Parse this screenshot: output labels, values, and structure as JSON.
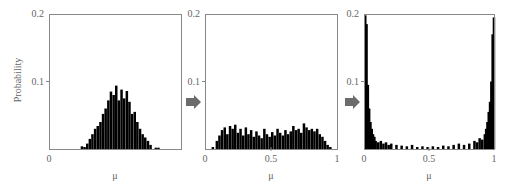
{
  "figure": {
    "ylabel": "Probability",
    "arrow_color": "#6b6b6b",
    "bar_color": "#000000",
    "frame_color": "#888888"
  },
  "chart_data": [
    {
      "type": "bar",
      "title": "",
      "xlabel": "μ",
      "ylabel": "Probability",
      "xlim": [
        0,
        1
      ],
      "ylim": [
        0,
        0.2
      ],
      "xticks": [
        "0"
      ],
      "yticks": [
        "0.1",
        "0.2"
      ],
      "grid": false,
      "description": "Unimodal distribution centered near μ=0.5, spanning ~0.25–0.8",
      "bin_width": 0.01,
      "x": [
        0.24,
        0.26,
        0.28,
        0.3,
        0.32,
        0.34,
        0.36,
        0.38,
        0.4,
        0.42,
        0.44,
        0.46,
        0.48,
        0.5,
        0.52,
        0.54,
        0.56,
        0.58,
        0.6,
        0.62,
        0.64,
        0.66,
        0.68,
        0.7,
        0.72,
        0.74,
        0.76,
        0.8,
        0.82
      ],
      "values": [
        0.004,
        0.003,
        0.008,
        0.015,
        0.022,
        0.03,
        0.034,
        0.04,
        0.052,
        0.06,
        0.072,
        0.085,
        0.08,
        0.094,
        0.072,
        0.088,
        0.075,
        0.086,
        0.07,
        0.052,
        0.055,
        0.04,
        0.03,
        0.022,
        0.017,
        0.012,
        0.006,
        0.002,
        0.002
      ]
    },
    {
      "type": "bar",
      "title": "",
      "xlabel": "μ",
      "ylabel": "",
      "xlim": [
        0,
        1
      ],
      "ylim": [
        0,
        0.2
      ],
      "xticks": [
        "0",
        "0.5",
        "1"
      ],
      "yticks": [
        "0.1",
        "0.2"
      ],
      "grid": false,
      "description": "Roughly flat distribution spanning ~0.05–0.95 at ~0.02–0.035",
      "bin_width": 0.01,
      "x": [
        0.05,
        0.08,
        0.1,
        0.12,
        0.14,
        0.16,
        0.18,
        0.2,
        0.22,
        0.24,
        0.26,
        0.28,
        0.3,
        0.32,
        0.34,
        0.36,
        0.38,
        0.4,
        0.42,
        0.44,
        0.46,
        0.48,
        0.5,
        0.52,
        0.54,
        0.56,
        0.58,
        0.6,
        0.62,
        0.64,
        0.66,
        0.68,
        0.7,
        0.72,
        0.74,
        0.76,
        0.78,
        0.8,
        0.82,
        0.84,
        0.86,
        0.88,
        0.9,
        0.92,
        0.94
      ],
      "values": [
        0.003,
        0.012,
        0.02,
        0.028,
        0.032,
        0.022,
        0.034,
        0.03,
        0.036,
        0.024,
        0.03,
        0.02,
        0.032,
        0.022,
        0.028,
        0.018,
        0.026,
        0.02,
        0.016,
        0.03,
        0.022,
        0.018,
        0.025,
        0.02,
        0.03,
        0.024,
        0.02,
        0.028,
        0.022,
        0.026,
        0.034,
        0.028,
        0.03,
        0.024,
        0.038,
        0.032,
        0.028,
        0.03,
        0.026,
        0.03,
        0.022,
        0.018,
        0.012,
        0.006,
        0.003
      ]
    },
    {
      "type": "bar",
      "title": "",
      "xlabel": "μ",
      "ylabel": "",
      "xlim": [
        0,
        1
      ],
      "ylim": [
        0,
        0.2
      ],
      "xticks": [
        "0",
        "0.5",
        "1"
      ],
      "yticks": [
        "0.1",
        "0.2"
      ],
      "grid": false,
      "description": "U-shaped distribution with peaks ~0.2 at μ=0 and μ=1, near-zero in the middle",
      "bin_width": 0.01,
      "x": [
        0.0,
        0.01,
        0.02,
        0.03,
        0.04,
        0.05,
        0.06,
        0.07,
        0.08,
        0.1,
        0.12,
        0.14,
        0.16,
        0.18,
        0.2,
        0.24,
        0.28,
        0.32,
        0.36,
        0.4,
        0.44,
        0.48,
        0.52,
        0.56,
        0.6,
        0.64,
        0.68,
        0.72,
        0.76,
        0.8,
        0.84,
        0.86,
        0.88,
        0.9,
        0.92,
        0.93,
        0.94,
        0.95,
        0.96,
        0.97,
        0.98,
        0.99
      ],
      "values": [
        0.198,
        0.185,
        0.095,
        0.06,
        0.04,
        0.03,
        0.022,
        0.018,
        0.012,
        0.01,
        0.012,
        0.008,
        0.01,
        0.006,
        0.008,
        0.006,
        0.005,
        0.004,
        0.006,
        0.003,
        0.004,
        0.003,
        0.004,
        0.003,
        0.005,
        0.004,
        0.006,
        0.008,
        0.006,
        0.008,
        0.012,
        0.01,
        0.016,
        0.014,
        0.022,
        0.03,
        0.04,
        0.055,
        0.07,
        0.1,
        0.17,
        0.195
      ]
    }
  ],
  "panels": [
    {
      "xticks": [
        {
          "v": 0,
          "t": "0"
        }
      ],
      "ytick_labels": {
        "top": "0.2",
        "mid": "0.1"
      },
      "xlabel": "μ"
    },
    {
      "xticks": [
        {
          "v": 0,
          "t": "0"
        },
        {
          "v": 0.5,
          "t": "0.5"
        },
        {
          "v": 1,
          "t": "1"
        }
      ],
      "ytick_labels": {
        "top": "0.2",
        "mid": "0.1"
      },
      "xlabel": "μ"
    },
    {
      "xticks": [
        {
          "v": 0,
          "t": "0"
        },
        {
          "v": 0.5,
          "t": "0.5"
        },
        {
          "v": 1,
          "t": "1"
        }
      ],
      "ytick_labels": {
        "top": "0.2",
        "mid": "0.1"
      },
      "xlabel": "μ"
    }
  ]
}
